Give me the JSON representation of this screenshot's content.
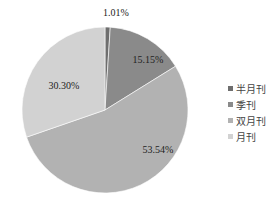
{
  "chart_data": {
    "type": "pie",
    "title": "",
    "categories": [
      "半月刊",
      "季刊",
      "双月刊",
      "月刊"
    ],
    "values": [
      1.01,
      15.15,
      53.54,
      30.3
    ],
    "labels": [
      "1.01%",
      "15.15%",
      "53.54%",
      "30.30%"
    ],
    "colors": [
      "#6e6e6e",
      "#8a8a8a",
      "#b2b2b2",
      "#d2d2d2"
    ],
    "start_angle": "12 o'clock",
    "direction": "clockwise",
    "legend_position": "right"
  },
  "legend": {
    "items": [
      {
        "label": "半月刊",
        "color": "#6e6e6e"
      },
      {
        "label": "季刊",
        "color": "#8a8a8a"
      },
      {
        "label": "双月刊",
        "color": "#b2b2b2"
      },
      {
        "label": "月刊",
        "color": "#d2d2d2"
      }
    ]
  }
}
